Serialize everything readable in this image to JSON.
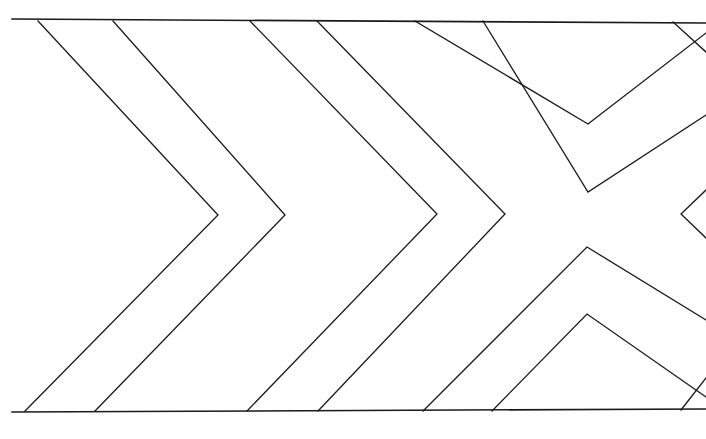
{
  "figure": {
    "title": "Nested chevron and crossed-diagonal line drawing",
    "kind": "line-art-geometric-diagram",
    "canvas": {
      "width": 706,
      "height": 439
    },
    "background_color": "#ffffff",
    "stroke_color": "#1a1a1a",
    "stroke_width": 1.3
  },
  "chart_data": {
    "type": "line",
    "title": "Nested chevron and crossed-diagonal line drawing",
    "subtitle": "",
    "xlabel": "",
    "ylabel": "",
    "xlim": [
      0,
      706
    ],
    "ylim": [
      0,
      439
    ],
    "grid": false,
    "legend_position": "none",
    "tick_labels_x": [],
    "tick_labels_y": [],
    "annotations": [],
    "series": [
      {
        "name": "top-border-rule",
        "role": "frame",
        "closed": false,
        "points": [
          [
            12,
            19
          ],
          [
            706,
            23
          ]
        ]
      },
      {
        "name": "bottom-border-rule",
        "role": "frame",
        "closed": false,
        "points": [
          [
            12,
            412
          ],
          [
            706,
            409
          ]
        ]
      },
      {
        "name": "chevron-1",
        "role": "chevron",
        "direction": "right",
        "apex": [
          218,
          215
        ],
        "closed": false,
        "points": [
          [
            38,
            21
          ],
          [
            218,
            215
          ],
          [
            25,
            411
          ]
        ]
      },
      {
        "name": "chevron-2",
        "role": "chevron",
        "direction": "right",
        "apex": [
          285,
          215
        ],
        "closed": false,
        "points": [
          [
            113,
            21
          ],
          [
            285,
            215
          ],
          [
            95,
            411
          ]
        ]
      },
      {
        "name": "chevron-3",
        "role": "chevron",
        "direction": "right",
        "apex": [
          437,
          214
        ],
        "closed": false,
        "points": [
          [
            250,
            21
          ],
          [
            437,
            214
          ],
          [
            247,
            411
          ]
        ]
      },
      {
        "name": "chevron-4",
        "role": "chevron",
        "direction": "right",
        "apex": [
          505,
          214
        ],
        "closed": false,
        "points": [
          [
            317,
            21
          ],
          [
            505,
            214
          ],
          [
            318,
            411
          ]
        ]
      },
      {
        "name": "chevron-5-upper-of-x",
        "role": "chevron",
        "direction": "down",
        "apex": [
          588,
          124
        ],
        "closed": false,
        "points": [
          [
            415,
            21
          ],
          [
            588,
            124
          ],
          [
            706,
            33
          ]
        ]
      },
      {
        "name": "chevron-6-upper-of-x",
        "role": "chevron",
        "direction": "down",
        "apex": [
          588,
          192
        ],
        "closed": false,
        "points": [
          [
            483,
            21
          ],
          [
            588,
            192
          ],
          [
            706,
            115
          ]
        ]
      },
      {
        "name": "chevron-7-lower-of-x",
        "role": "chevron",
        "direction": "up",
        "apex": [
          587,
          247
        ],
        "closed": false,
        "points": [
          [
            706,
            320
          ],
          [
            587,
            247
          ],
          [
            423,
            411
          ]
        ]
      },
      {
        "name": "chevron-8-lower-of-x",
        "role": "chevron",
        "direction": "up",
        "apex": [
          587,
          314
        ],
        "closed": false,
        "points": [
          [
            706,
            397
          ],
          [
            587,
            314
          ],
          [
            492,
            411
          ]
        ]
      },
      {
        "name": "chevron-9-right-margin",
        "role": "chevron",
        "direction": "left",
        "apex": [
          681,
          214
        ],
        "closed": false,
        "points": [
          [
            706,
            190
          ],
          [
            681,
            214
          ],
          [
            706,
            238
          ]
        ]
      },
      {
        "name": "diagonal-right-top",
        "role": "diagonal",
        "closed": false,
        "points": [
          [
            673,
            22
          ],
          [
            706,
            52
          ]
        ]
      },
      {
        "name": "diagonal-right-bottom",
        "role": "diagonal",
        "closed": false,
        "points": [
          [
            706,
            378
          ],
          [
            681,
            410
          ]
        ]
      }
    ]
  }
}
